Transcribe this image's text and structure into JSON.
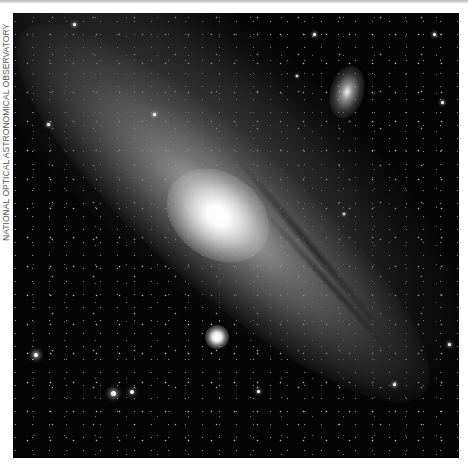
{
  "credit": {
    "text": "NATIONAL OPTICAL ASTRONOMICAL OBSERVATORY"
  },
  "photo": {
    "subject": "spiral galaxy with two satellite galaxies",
    "colors": {
      "background": "#040404",
      "core": "#ffffff",
      "disk": "#9a9a9a",
      "border": "#ffffff"
    }
  }
}
